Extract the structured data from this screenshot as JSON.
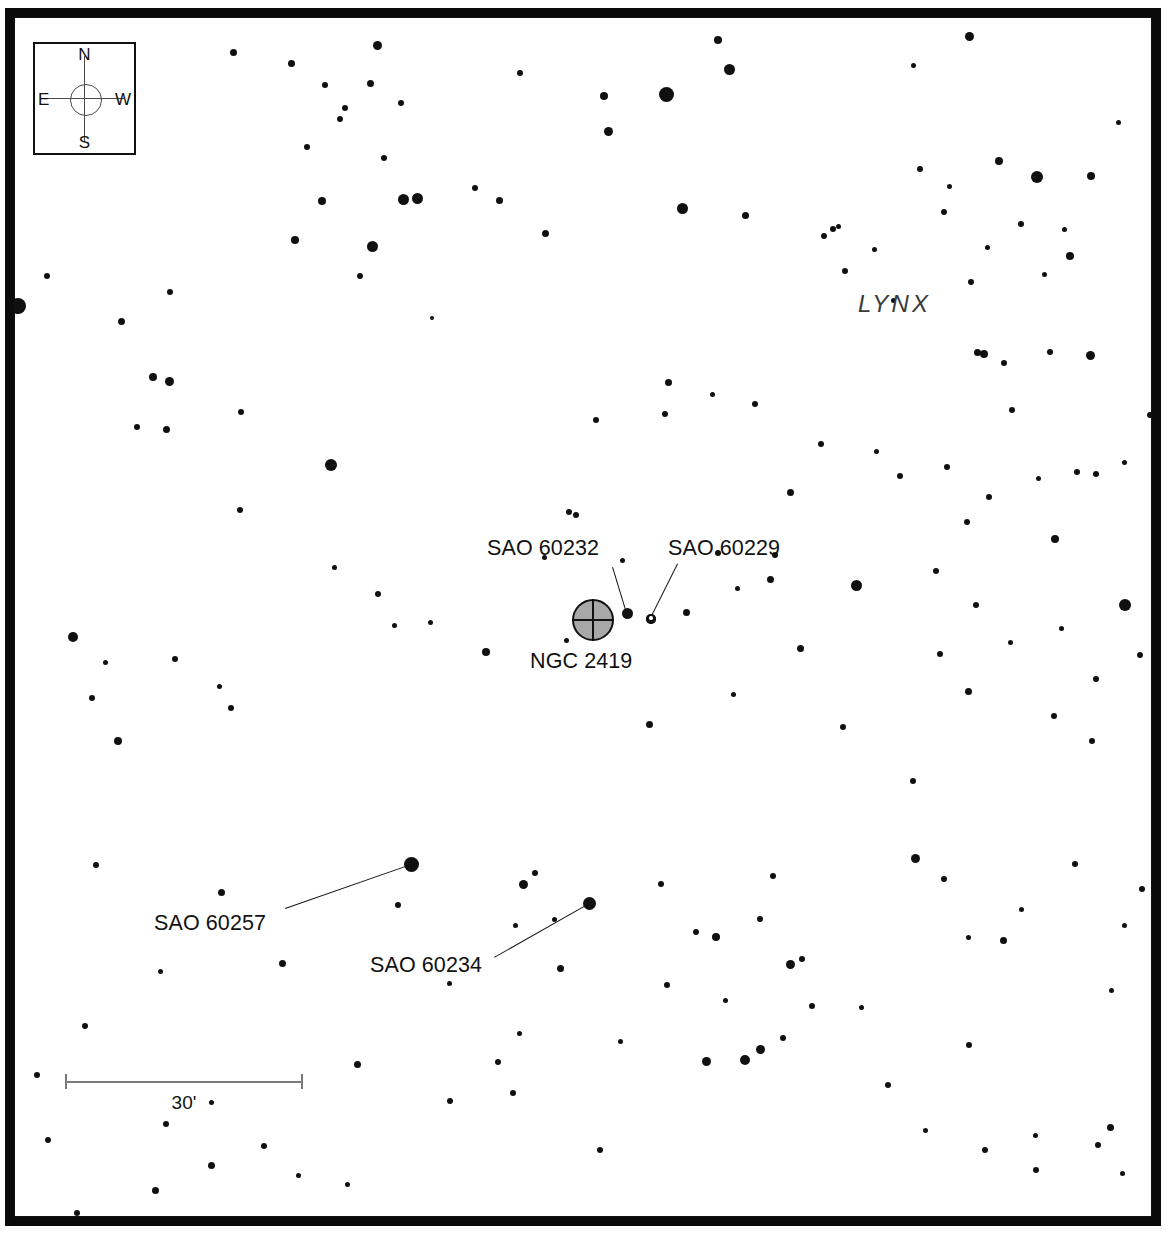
{
  "chart_type": "star-chart",
  "constellation_label": "LYNX",
  "scale": {
    "length_label": "30'",
    "bar_px": 238
  },
  "compass": {
    "north": "N",
    "south": "S",
    "east": "E",
    "west": "W"
  },
  "colors": {
    "star": "#101010",
    "frame": "#0a0a0a",
    "cluster_fill": "#a8a8a8",
    "scale_line": "#7a7a7a",
    "constellation_text": "#3b3b3b"
  },
  "objects": [
    {
      "id": "ngc2419",
      "label": "NGC 2419",
      "type": "globular-cluster",
      "symbol_x": 572,
      "symbol_y": 599,
      "symbol_d": 42,
      "label_x": 530,
      "label_y": 651,
      "leader": null
    },
    {
      "id": "sao60232",
      "label": "SAO 60232",
      "type": "star",
      "label_x": 487,
      "label_y": 538,
      "leader": {
        "x1": 613,
        "y1": 567,
        "x2": 627,
        "y2": 613
      }
    },
    {
      "id": "sao60229",
      "label": "SAO 60229",
      "type": "double-star",
      "label_x": 668,
      "label_y": 538,
      "leader": {
        "x1": 678,
        "y1": 564,
        "x2": 651,
        "y2": 618
      }
    },
    {
      "id": "sao60257",
      "label": "SAO 60257",
      "type": "star",
      "label_x": 154,
      "label_y": 913,
      "leader": {
        "x1": 285,
        "y1": 908,
        "x2": 411,
        "y2": 864
      }
    },
    {
      "id": "sao60234",
      "label": "SAO 60234",
      "type": "star",
      "label_x": 370,
      "label_y": 955,
      "leader": {
        "x1": 494,
        "y1": 957,
        "x2": 589,
        "y2": 903
      }
    }
  ],
  "stars": [
    [
      233,
      52,
      7
    ],
    [
      291,
      63,
      7
    ],
    [
      377,
      45,
      9
    ],
    [
      520,
      73,
      6
    ],
    [
      604,
      96,
      8
    ],
    [
      666,
      94,
      15
    ],
    [
      718,
      40,
      8
    ],
    [
      729,
      69,
      11
    ],
    [
      913,
      65,
      5
    ],
    [
      969,
      36,
      9
    ],
    [
      1037,
      177,
      12
    ],
    [
      999,
      161,
      8
    ],
    [
      1091,
      176,
      8
    ],
    [
      1118,
      122,
      5
    ],
    [
      1070,
      256,
      8
    ],
    [
      370,
      83,
      7
    ],
    [
      345,
      108,
      6
    ],
    [
      340,
      119,
      6
    ],
    [
      401,
      103,
      6
    ],
    [
      325,
      85,
      6
    ],
    [
      307,
      147,
      6
    ],
    [
      384,
      158,
      6
    ],
    [
      295,
      240,
      8
    ],
    [
      322,
      201,
      8
    ],
    [
      403,
      199,
      11
    ],
    [
      417,
      198,
      11
    ],
    [
      372,
      246,
      11
    ],
    [
      360,
      276,
      6
    ],
    [
      545,
      233,
      7
    ],
    [
      499,
      200,
      7
    ],
    [
      475,
      188,
      6
    ],
    [
      608,
      131,
      9
    ],
    [
      682,
      208,
      11
    ],
    [
      745,
      215,
      7
    ],
    [
      824,
      236,
      6
    ],
    [
      833,
      229,
      6
    ],
    [
      838,
      226,
      5
    ],
    [
      845,
      271,
      6
    ],
    [
      874,
      249,
      5
    ],
    [
      893,
      300,
      5
    ],
    [
      920,
      169,
      6
    ],
    [
      949,
      186,
      5
    ],
    [
      984,
      354,
      8
    ],
    [
      1004,
      363,
      6
    ],
    [
      944,
      212,
      6
    ],
    [
      987,
      247,
      5
    ],
    [
      1021,
      224,
      6
    ],
    [
      971,
      282,
      6
    ],
    [
      1044,
      274,
      5
    ],
    [
      1064,
      229,
      5
    ],
    [
      170,
      292,
      6
    ],
    [
      47,
      276,
      6
    ],
    [
      18,
      306,
      16
    ],
    [
      121,
      321,
      7
    ],
    [
      153,
      377,
      8
    ],
    [
      169,
      381,
      9
    ],
    [
      241,
      412,
      6
    ],
    [
      137,
      427,
      6
    ],
    [
      166,
      429,
      7
    ],
    [
      331,
      465,
      12
    ],
    [
      240,
      510,
      6
    ],
    [
      394,
      625,
      5
    ],
    [
      486,
      652,
      8
    ],
    [
      334,
      567,
      5
    ],
    [
      378,
      594,
      6
    ],
    [
      430,
      622,
      5
    ],
    [
      569,
      512,
      6
    ],
    [
      596,
      420,
      6
    ],
    [
      668,
      382,
      7
    ],
    [
      665,
      414,
      6
    ],
    [
      712,
      394,
      5
    ],
    [
      755,
      404,
      6
    ],
    [
      790,
      492,
      7
    ],
    [
      821,
      444,
      6
    ],
    [
      876,
      451,
      5
    ],
    [
      900,
      476,
      6
    ],
    [
      947,
      467,
      6
    ],
    [
      936,
      571,
      6
    ],
    [
      967,
      522,
      6
    ],
    [
      1055,
      539,
      8
    ],
    [
      1077,
      472,
      6
    ],
    [
      1096,
      474,
      6
    ],
    [
      1125,
      605,
      12
    ],
    [
      940,
      654,
      6
    ],
    [
      1010,
      642,
      5
    ],
    [
      1061,
      628,
      5
    ],
    [
      1054,
      716,
      6
    ],
    [
      968,
      691,
      7
    ],
    [
      913,
      781,
      6
    ],
    [
      856,
      585,
      11
    ],
    [
      800,
      648,
      7
    ],
    [
      770,
      579,
      7
    ],
    [
      775,
      555,
      6
    ],
    [
      718,
      553,
      6
    ],
    [
      686,
      612,
      7
    ],
    [
      651,
      619,
      10
    ],
    [
      627,
      613,
      11
    ],
    [
      622,
      560,
      5
    ],
    [
      737,
      588,
      5
    ],
    [
      733,
      694,
      5
    ],
    [
      649,
      724,
      7
    ],
    [
      576,
      515,
      6
    ],
    [
      544,
      557,
      5
    ],
    [
      73,
      637,
      10
    ],
    [
      92,
      698,
      6
    ],
    [
      105,
      662,
      5
    ],
    [
      118,
      741,
      8
    ],
    [
      175,
      659,
      6
    ],
    [
      219,
      686,
      5
    ],
    [
      231,
      708,
      6
    ],
    [
      96,
      865,
      6
    ],
    [
      221,
      892,
      7
    ],
    [
      160,
      971,
      5
    ],
    [
      282,
      963,
      7
    ],
    [
      398,
      905,
      6
    ],
    [
      411,
      864,
      15
    ],
    [
      523,
      884,
      9
    ],
    [
      535,
      873,
      6
    ],
    [
      589,
      903,
      13
    ],
    [
      554,
      919,
      5
    ],
    [
      515,
      925,
      5
    ],
    [
      449,
      983,
      5
    ],
    [
      560,
      968,
      7
    ],
    [
      661,
      884,
      6
    ],
    [
      696,
      932,
      6
    ],
    [
      716,
      937,
      8
    ],
    [
      760,
      919,
      6
    ],
    [
      790,
      964,
      9
    ],
    [
      802,
      959,
      6
    ],
    [
      915,
      858,
      9
    ],
    [
      944,
      879,
      6
    ],
    [
      1021,
      909,
      5
    ],
    [
      1075,
      864,
      6
    ],
    [
      968,
      937,
      5
    ],
    [
      1003,
      940,
      7
    ],
    [
      1111,
      990,
      5
    ],
    [
      1142,
      889,
      6
    ],
    [
      1124,
      925,
      5
    ],
    [
      843,
      727,
      6
    ],
    [
      773,
      876,
      6
    ],
    [
      667,
      985,
      6
    ],
    [
      725,
      1000,
      5
    ],
    [
      783,
      1038,
      6
    ],
    [
      706,
      1061,
      9
    ],
    [
      745,
      1060,
      10
    ],
    [
      760,
      1049,
      9
    ],
    [
      812,
      1006,
      6
    ],
    [
      861,
      1007,
      5
    ],
    [
      888,
      1085,
      6
    ],
    [
      969,
      1045,
      6
    ],
    [
      1035,
      1135,
      5
    ],
    [
      1098,
      1145,
      6
    ],
    [
      1122,
      1173,
      5
    ],
    [
      1110,
      1127,
      7
    ],
    [
      1166,
      1131,
      5
    ],
    [
      925,
      1130,
      5
    ],
    [
      985,
      1150,
      6
    ],
    [
      1036,
      1170,
      6
    ],
    [
      600,
      1150,
      6
    ],
    [
      513,
      1093,
      6
    ],
    [
      450,
      1101,
      6
    ],
    [
      357,
      1064,
      7
    ],
    [
      264,
      1146,
      6
    ],
    [
      211,
      1165,
      7
    ],
    [
      155,
      1190,
      7
    ],
    [
      77,
      1213,
      6
    ],
    [
      37,
      1075,
      6
    ],
    [
      85,
      1026,
      6
    ],
    [
      48,
      1140,
      6
    ],
    [
      166,
      1124,
      6
    ],
    [
      211,
      1102,
      5
    ],
    [
      298,
      1175,
      5
    ],
    [
      347,
      1184,
      5
    ],
    [
      498,
      1062,
      6
    ],
    [
      620,
      1041,
      5
    ],
    [
      519,
      1033,
      5
    ],
    [
      1150,
      415,
      6
    ],
    [
      1124,
      462,
      5
    ],
    [
      1012,
      410,
      6
    ],
    [
      1090,
      355,
      9
    ],
    [
      977,
      352,
      7
    ],
    [
      989,
      497,
      6
    ],
    [
      1038,
      478,
      5
    ],
    [
      976,
      605,
      6
    ],
    [
      1050,
      352,
      6
    ],
    [
      1096,
      679,
      6
    ],
    [
      1140,
      655,
      6
    ],
    [
      1092,
      741,
      6
    ],
    [
      1157,
      789,
      5
    ],
    [
      432,
      318,
      4
    ],
    [
      566,
      640,
      5
    ]
  ]
}
